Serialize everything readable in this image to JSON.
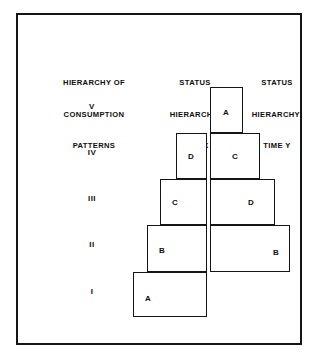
{
  "figure": {
    "background_color": "#ffffff",
    "line_color": "#151515",
    "text_color": "#0d0d0d"
  },
  "headers": {
    "col1": {
      "line1": "HIERARCHY OF",
      "line2": "CONSUMPTION",
      "line3": "PATTERNS"
    },
    "col2": {
      "line1": "STATUS",
      "line2": "HIERARCHY:",
      "line3": "TIME X"
    },
    "col3": {
      "line1": "STATUS",
      "line2": "HIERARCHY:",
      "line3": "TIME Y"
    }
  },
  "row_labels": [
    {
      "label": "V",
      "top": 100
    },
    {
      "label": "IV",
      "top": 146
    },
    {
      "label": "III",
      "top": 192
    },
    {
      "label": "II",
      "top": 238
    },
    {
      "label": "I",
      "top": 285
    }
  ],
  "chart_data": {
    "type": "bar",
    "orientation": "horizontal-stacked-pyramid",
    "categories": [
      "V",
      "IV",
      "III",
      "II",
      "I"
    ],
    "xlabel": "",
    "ylabel": "HIERARCHY OF CONSUMPTION PATTERNS",
    "grid": false,
    "legend": "none",
    "series": [
      {
        "name": "STATUS HIERARCHY: TIME X",
        "tiers": [
          {
            "tier": "V",
            "letter": "",
            "present": false
          },
          {
            "tier": "IV",
            "letter": "D",
            "left": 174,
            "top": 131,
            "width": 31,
            "height": 46
          },
          {
            "tier": "III",
            "letter": "C",
            "left": 158,
            "top": 177,
            "width": 47,
            "height": 46
          },
          {
            "tier": "II",
            "letter": "B",
            "left": 145,
            "top": 223,
            "width": 60,
            "height": 47
          },
          {
            "tier": "I",
            "letter": "A",
            "left": 131,
            "top": 270,
            "width": 74,
            "height": 45
          }
        ]
      },
      {
        "name": "STATUS HIERARCHY: TIME Y",
        "tiers": [
          {
            "tier": "V",
            "letter": "A",
            "left": 208,
            "top": 85,
            "width": 33,
            "height": 46
          },
          {
            "tier": "IV",
            "letter": "C",
            "left": 208,
            "top": 131,
            "width": 50,
            "height": 46
          },
          {
            "tier": "III",
            "letter": "D",
            "left": 208,
            "top": 177,
            "width": 65,
            "height": 46
          },
          {
            "tier": "II",
            "letter": "B",
            "left": 208,
            "top": 223,
            "width": 80,
            "height": 47
          },
          {
            "tier": "I",
            "letter": "",
            "present": false
          }
        ]
      }
    ]
  },
  "boxes_x": [
    {
      "letter": "D",
      "label_left": 11,
      "label_top": 18
    },
    {
      "letter": "C",
      "label_left": 11,
      "label_top": 18
    },
    {
      "letter": "B",
      "label_left": 11,
      "label_top": 20
    },
    {
      "letter": "A",
      "label_left": 11,
      "label_top": 21
    }
  ],
  "boxes_y": [
    {
      "letter": "A",
      "label_left": 12,
      "label_top": 20
    },
    {
      "letter": "C",
      "label_left": 21,
      "label_top": 18
    },
    {
      "letter": "D",
      "label_left": 37,
      "label_top": 18
    },
    {
      "letter": "B",
      "label_left": 62,
      "label_top": 22
    }
  ]
}
